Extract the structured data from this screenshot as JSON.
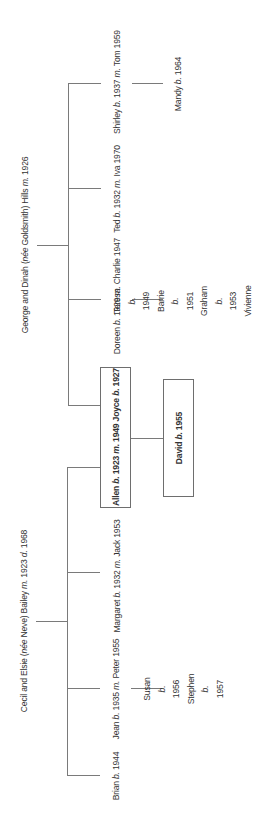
{
  "families": {
    "hills": {
      "title_pre": "George and Dinah (",
      "title_nee": "née",
      "title_mid": " Goldsmith) Hills ",
      "title_m": "m.",
      "title_post": " 1926"
    },
    "bailey": {
      "title_pre": "Cecil and Elsie (",
      "title_nee": "née",
      "title_mid": " Neve) Bailey ",
      "title_m": "m.",
      "title_mid2": " 1923 ",
      "title_d": "d.",
      "title_post": " 1968"
    }
  },
  "hills_children": [
    {
      "name": "Shirley ",
      "b": "b.",
      "year": " 1937 ",
      "m": "m.",
      "spouse": " Tom 1959"
    },
    {
      "name": "Ted ",
      "b": "b.",
      "year": " 1932 ",
      "m": "m.",
      "spouse": " Iva 1970"
    },
    {
      "name": "Doreen ",
      "b": "b.",
      "year": " 1929 ",
      "m": "m.",
      "spouse": " Charlie 1947"
    }
  ],
  "bailey_children": [
    {
      "name": "Margaret ",
      "b": "b.",
      "year": " 1932 ",
      "m": "m.",
      "spouse": " Jack 1953"
    },
    {
      "name": "Jean ",
      "b": "b.",
      "year": " 1935 ",
      "m": "m.",
      "spouse": " Peter 1955"
    },
    {
      "name": "Brian ",
      "b": "b.",
      "year": " 1944"
    }
  ],
  "couple": {
    "name": "Allen ",
    "b": "b.",
    "year": " 1923 ",
    "m": "m.",
    "myear": " 1949 Joyce ",
    "b2": "b.",
    "year2": " 1927"
  },
  "couple_child": {
    "name": "David ",
    "b": "b.",
    "year": " 1955"
  },
  "grandchildren": {
    "mandy": [
      {
        "name": "Mandy ",
        "b": "b.",
        "year": " 1964"
      }
    ],
    "doreen": [
      {
        "name": "Teresa ",
        "b": "b.",
        "year": " 1949"
      },
      {
        "name": "Barrie ",
        "b": "b.",
        "year": " 1951"
      },
      {
        "name": "Graham ",
        "b": "b.",
        "year": " 1953"
      },
      {
        "name": "Vivienne ",
        "b": "b.",
        "year": " 1960"
      }
    ],
    "jean": [
      {
        "name": "Susan ",
        "b": "b.",
        "year": " 1956"
      },
      {
        "name": "Stephen ",
        "b": "b.",
        "year": " 1957"
      }
    ]
  },
  "colors": {
    "line": "#7a7a7a",
    "text": "#333333",
    "background": "#ffffff"
  }
}
